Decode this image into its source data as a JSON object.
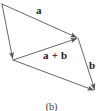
{
  "figure": {
    "caption": "(b)",
    "background_color": "#ffffff",
    "stroke_color": "#555555",
    "label_color": "#1c1c1c"
  },
  "labels": {
    "vector_a": "a",
    "vector_b": "b",
    "vector_sum": "a + b"
  },
  "geometry": {
    "vertices": {
      "top_left": {
        "x": 2,
        "y": 4
      },
      "left": {
        "x": 13,
        "y": 60
      },
      "top_right": {
        "x": 78,
        "y": 38
      },
      "bottom_right": {
        "x": 95,
        "y": 91
      }
    },
    "edges": [
      {
        "name": "a-top",
        "from": "top_left",
        "to": "top_right",
        "arrow": "to",
        "label": "a"
      },
      {
        "name": "b-right",
        "from": "top_right",
        "to": "bottom_right",
        "arrow": "to",
        "label": "b"
      },
      {
        "name": "a-bottom",
        "from": "left",
        "to": "bottom_right",
        "arrow": "to",
        "label": ""
      },
      {
        "name": "b-left",
        "from": "top_left",
        "to": "left",
        "arrow": "to",
        "label": ""
      },
      {
        "name": "resultant",
        "from": "left",
        "to": "top_right",
        "arrow": "to",
        "label": "a + b"
      }
    ]
  }
}
